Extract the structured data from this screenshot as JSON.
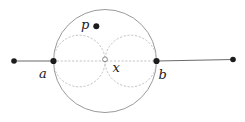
{
  "figure": {
    "width": 245,
    "height": 122,
    "colors": {
      "background": "#ffffff",
      "solid_line": "#6b6b6b",
      "main_circle_stroke": "#9a9a9a",
      "dotted_stroke": "#c3c3c3",
      "point_fill": "#1c1c1c",
      "open_point_stroke": "#8a8a8a",
      "open_point_fill": "#ffffff",
      "label_color": "#1a1a1a"
    },
    "main_circle": {
      "cx": 105,
      "cy": 61,
      "r": 51.5
    },
    "dotted_circles": [
      {
        "name": "dotted-circle-left",
        "cx": 79.3,
        "cy": 61,
        "r": 25.8
      },
      {
        "name": "dotted-circle-right",
        "cx": 130.8,
        "cy": 61,
        "r": 25.8
      }
    ],
    "dotted_diameter": {
      "x1": 53.5,
      "y1": 61,
      "x2": 156.5,
      "y2": 61
    },
    "solid_segments": [
      {
        "name": "line-left-segment",
        "x1": 14,
        "y1": 61,
        "x2": 53.5,
        "y2": 61
      },
      {
        "name": "line-right-segment",
        "x1": 156.5,
        "y1": 61,
        "x2": 233,
        "y2": 59.5
      }
    ],
    "filled_points": [
      {
        "name": "left-endpoint-dot",
        "x": 14,
        "y": 61,
        "r": 2.8
      },
      {
        "name": "point-a-dot",
        "x": 53.5,
        "y": 61,
        "r": 3.1
      },
      {
        "name": "point-b-dot",
        "x": 156.5,
        "y": 61,
        "r": 3.1
      },
      {
        "name": "right-endpoint-dot",
        "x": 233,
        "y": 59.5,
        "r": 2.8
      },
      {
        "name": "point-p-dot",
        "x": 96.3,
        "y": 26.3,
        "r": 3.0
      }
    ],
    "open_point": {
      "name": "center-x-marker",
      "x": 105,
      "y": 59.3,
      "r": 2.4
    },
    "labels": [
      {
        "name": "label-p",
        "text": "p",
        "x": 81,
        "y": 29,
        "font_size": 13
      },
      {
        "name": "label-a",
        "text": "a",
        "x": 39,
        "y": 78,
        "font_size": 13
      },
      {
        "name": "label-x",
        "text": "x",
        "x": 112.5,
        "y": 71.5,
        "font_size": 13
      },
      {
        "name": "label-b",
        "text": "b",
        "x": 158.5,
        "y": 79,
        "font_size": 13
      }
    ]
  }
}
